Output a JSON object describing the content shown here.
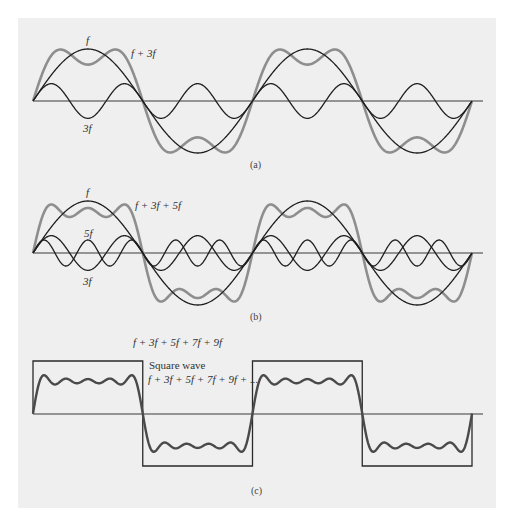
{
  "colors": {
    "page_background": "#ffffff",
    "panel_background": "#efefef",
    "axis": "#3a3a3a",
    "component_wave": "#1e1e1e",
    "sum_wave": "#8e8e8e",
    "square_wave": "#2a2a2a",
    "sum_wave_c": "#4a4a4a"
  },
  "geometry": {
    "x_start": 33,
    "x_end": 483,
    "wave_x_end": 472,
    "period_px": 219.5,
    "fundamental_amplitude_px": 52
  },
  "panels": [
    {
      "id": "a",
      "caption": "(a)",
      "axis_y": 101,
      "labels": {
        "fundamental": "f",
        "sum": "f + 3f",
        "third": "3f"
      },
      "components": [
        {
          "name": "f",
          "harmonic": 1
        },
        {
          "name": "3f",
          "harmonic": 3
        }
      ],
      "sum": {
        "name": "f + 3f",
        "harmonics": [
          1,
          3
        ]
      }
    },
    {
      "id": "b",
      "caption": "(b)",
      "axis_y": 253,
      "labels": {
        "fundamental": "f",
        "sum": "f + 3f + 5f",
        "fifth": "5f",
        "third": "3f"
      },
      "components": [
        {
          "name": "f",
          "harmonic": 1
        },
        {
          "name": "3f",
          "harmonic": 3
        },
        {
          "name": "5f",
          "harmonic": 5
        }
      ],
      "sum": {
        "name": "f + 3f + 5f",
        "harmonics": [
          1,
          3,
          5
        ]
      }
    },
    {
      "id": "c",
      "caption": "(c)",
      "axis_y": 414,
      "labels": {
        "sum": "f + 3f + 5f + 7f + 9f",
        "square_title": "Square wave",
        "square_series": "f + 3f + 5f + 7f + 9f + ..."
      },
      "sum": {
        "name": "f + 3f + 5f + 7f + 9f",
        "harmonics": [
          1,
          3,
          5,
          7,
          9
        ]
      },
      "square_wave": {
        "high_y": 361,
        "low_y": 466
      }
    }
  ]
}
